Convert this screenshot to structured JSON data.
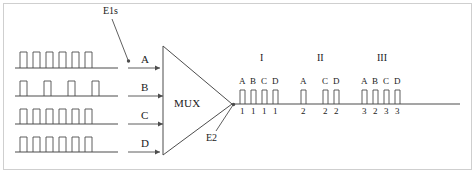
{
  "diagram": {
    "title_tags": {
      "source_tag": "E1s",
      "control_tag": "E2"
    },
    "mux": {
      "label": "MUX"
    },
    "inputs": [
      {
        "label": "A",
        "pulse_count": 6,
        "pattern": "dense",
        "baseline_y": 68,
        "pulses": [
          20,
          33,
          46,
          59,
          72,
          85
        ]
      },
      {
        "label": "B",
        "pulse_count": 4,
        "pattern": "sparse",
        "baseline_y": 96,
        "pulses": [
          20,
          44,
          68,
          92
        ]
      },
      {
        "label": "C",
        "pulse_count": 6,
        "pattern": "dense",
        "baseline_y": 124,
        "pulses": [
          20,
          33,
          46,
          59,
          72,
          85
        ]
      },
      {
        "label": "D",
        "pulse_count": 6,
        "pattern": "dense",
        "baseline_y": 152,
        "pulses": [
          20,
          33,
          46,
          59,
          72,
          85
        ]
      }
    ],
    "output": {
      "baseline_y": 104,
      "line_start_x": 232,
      "line_end_x": 460,
      "groups": [
        {
          "roman": "I",
          "roman_x": 262,
          "slots": [
            {
              "channel": "A",
              "digit": "1",
              "x": 240,
              "present": true
            },
            {
              "channel": "B",
              "digit": "1",
              "x": 251,
              "present": true
            },
            {
              "channel": "C",
              "digit": "1",
              "x": 262,
              "present": true
            },
            {
              "channel": "D",
              "digit": "1",
              "x": 273,
              "present": true
            }
          ]
        },
        {
          "roman": "II",
          "roman_x": 319,
          "slots": [
            {
              "channel": "A",
              "digit": "2",
              "x": 301,
              "present": true
            },
            {
              "channel": "",
              "digit": "",
              "x": 312,
              "present": false
            },
            {
              "channel": "C",
              "digit": "2",
              "x": 323,
              "present": true
            },
            {
              "channel": "D",
              "digit": "2",
              "x": 334,
              "present": true
            }
          ]
        },
        {
          "roman": "III",
          "roman_x": 380,
          "slots": [
            {
              "channel": "A",
              "digit": "3",
              "x": 362,
              "present": true
            },
            {
              "channel": "B",
              "digit": "2",
              "x": 373,
              "present": true
            },
            {
              "channel": "C",
              "digit": "3",
              "x": 384,
              "present": true
            },
            {
              "channel": "D",
              "digit": "3",
              "x": 395,
              "present": true
            }
          ]
        }
      ]
    },
    "colors": {
      "stroke": "#4d4d4d",
      "text": "#1a1a1a",
      "frame": "#cfcfcf"
    }
  }
}
